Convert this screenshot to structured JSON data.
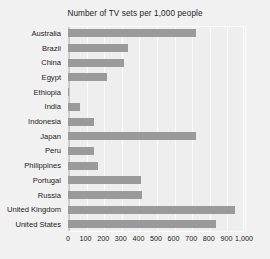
{
  "chart_data": {
    "type": "bar",
    "orientation": "horizontal",
    "title": "Number of TV sets  per 1,000 people",
    "xlabel": "",
    "ylabel": "",
    "xlim": [
      0,
      1000
    ],
    "xticks": [
      "0",
      "100",
      "200",
      "300",
      "400",
      "500",
      "600",
      "700",
      "800",
      "900",
      "1,000"
    ],
    "xtick_values": [
      0,
      100,
      200,
      300,
      400,
      500,
      600,
      700,
      800,
      900,
      1000
    ],
    "grid": true,
    "legend": "none",
    "categories": [
      "Australia",
      "Brazil",
      "China",
      "Egypt",
      "Ethiopia",
      "India",
      "Indonesia",
      "Japan",
      "Peru",
      "Philippines",
      "Portugal",
      "Russia",
      "United Kingdom",
      "United States"
    ],
    "values": [
      725,
      340,
      320,
      220,
      5,
      70,
      150,
      725,
      145,
      170,
      415,
      420,
      950,
      840
    ],
    "bar_color": "#9a9a9a",
    "plot_background": "#eeeeee",
    "figure_background": "#f1f1f1"
  }
}
